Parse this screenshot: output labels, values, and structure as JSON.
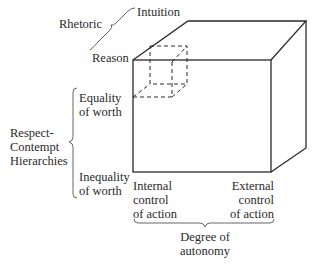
{
  "diagram": {
    "type": "3d-cube",
    "axes": {
      "depth_axis": {
        "label": "Rhetoric",
        "near_end": "Reason",
        "far_end": "Intuition"
      },
      "vertical_axis": {
        "label_line1": "Respect-",
        "label_line2": "Contempt",
        "label_line3": "Hierarchies",
        "top_end_line1": "Equality",
        "top_end_line2": "of worth",
        "bottom_end_line1": "Inequality",
        "bottom_end_line2": "of worth"
      },
      "horizontal_axis": {
        "label_line1": "Degree of",
        "label_line2": "autonomy",
        "left_end_line1": "Internal",
        "left_end_line2": "control",
        "left_end_line3": "of action",
        "right_end_line1": "External",
        "right_end_line2": "control",
        "right_end_line3": "of action"
      }
    },
    "inner_cube": {
      "style": "dashed",
      "position": "top-left-front corner (Reason / Equality of worth / Internal control)"
    },
    "colors": {
      "line": "#2a2a2a",
      "background": "#ffffff"
    }
  }
}
